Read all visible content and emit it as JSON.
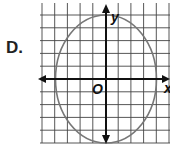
{
  "option_label": "D.",
  "graph": {
    "x_axis_label": "x",
    "y_axis_label": "y",
    "origin_label": "O",
    "grid_step_units": 1,
    "ellipse": {
      "center": [
        0,
        0
      ],
      "semi_axis_x": 4,
      "semi_axis_y": 5
    },
    "colors": {
      "grid": "#444444",
      "axes": "#111111",
      "curve": "#777777"
    }
  }
}
